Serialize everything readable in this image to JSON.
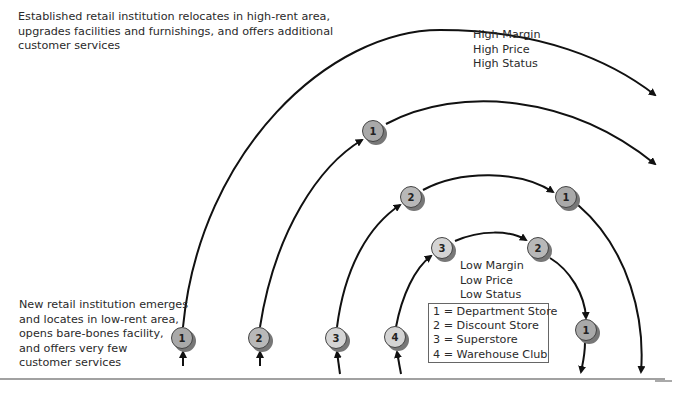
{
  "top_description": "Established retail institution relocates in high-rent area,\nupgrades facilities and furnishings, and offers additional\ncustomer services",
  "bottom_description": "New retail institution emerges\nand locates in low-rent area,\nopens bare-bones facility,\nand offers very few\ncustomer services",
  "high_label": "High Margin\nHigh Price\nHigh Status",
  "low_label": "Low Margin\nLow Price\nLow Status",
  "legend": [
    "1 = Department Store",
    "2 = Discount Store",
    "3 = Superstore",
    "4 = Warehouse Club"
  ],
  "nodes": {
    "bottom_1": "1",
    "bottom_2": "2",
    "bottom_3": "3",
    "bottom_4": "4",
    "arc2_1": "1",
    "arc3_2": "2",
    "arc3_1": "1",
    "arc4_3": "3",
    "arc4_2": "2",
    "arc4_1": "1"
  },
  "colors": {
    "line": "#111111",
    "node_dept": "#a9a9a9",
    "node_discount": "#b8b8b8",
    "node_light": "#d4d4d4"
  }
}
